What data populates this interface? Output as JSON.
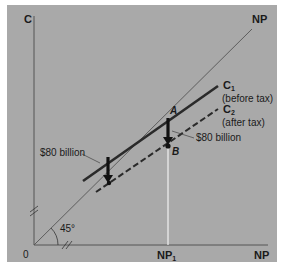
{
  "diagram": {
    "axes": {
      "y_label": "C",
      "x_label": "NP",
      "origin_label": "0",
      "x_marker_label": "NP",
      "x_marker_sub": "1"
    },
    "lines": {
      "forty_five": {
        "label": "NP",
        "angle_label": "45°"
      },
      "c1": {
        "label": "C",
        "sub": "1",
        "note": "(before tax)"
      },
      "c2": {
        "label": "C",
        "sub": "2",
        "note": "(after tax)"
      }
    },
    "points": {
      "a": "A",
      "b": "B"
    },
    "annotations": {
      "shift_left": "$80 billion",
      "shift_right": "$80 billion"
    },
    "colors": {
      "panel": "#a9a9a9",
      "line": "#2a2a2a",
      "guide": "#f2f2f2"
    }
  }
}
